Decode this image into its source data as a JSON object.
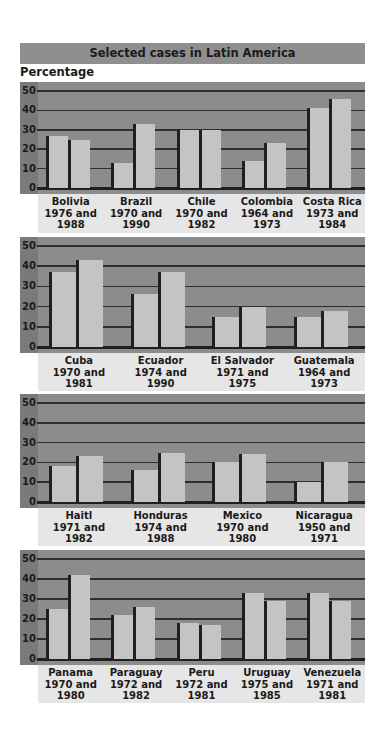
{
  "header": {
    "title": "Selected cases in Latin America",
    "ylabel": "Percentage"
  },
  "colors": {
    "title_bar": "#8f8f8f",
    "plot_bg": "#8c8c8c",
    "axis_strip": "#7a7a7a",
    "bar": "#c4c4c4",
    "label_bg": "#e6e6e6",
    "lines": "#1f1f1f"
  },
  "ticks": [
    "50",
    "40",
    "30",
    "20",
    "10",
    "0"
  ],
  "chart_data": [
    {
      "type": "bar",
      "title": "Selected cases in Latin America",
      "ylabel": "Percentage",
      "ylim": [
        0,
        50
      ],
      "grid": true,
      "categories": [
        "Bolivia 1976 and 1988",
        "Brazil 1970 and 1990",
        "Chile 1970 and 1982",
        "Colombia 1964 and 1973",
        "Costa Rica 1973 and 1984"
      ],
      "series": [
        {
          "name": "Earlier year",
          "values": [
            27,
            13,
            30,
            14,
            41
          ]
        },
        {
          "name": "Later year",
          "values": [
            25,
            33,
            30,
            23,
            46
          ]
        }
      ]
    },
    {
      "type": "bar",
      "ylabel": "Percentage",
      "ylim": [
        0,
        50
      ],
      "grid": true,
      "categories": [
        "Cuba 1970 and 1981",
        "Ecuador 1974 and 1990",
        "El Salvador 1971 and 1975",
        "Guatemala 1964 and 1973"
      ],
      "series": [
        {
          "name": "Earlier year",
          "values": [
            37,
            26,
            15,
            15
          ]
        },
        {
          "name": "Later year",
          "values": [
            43,
            37,
            20,
            18
          ]
        }
      ]
    },
    {
      "type": "bar",
      "ylabel": "Percentage",
      "ylim": [
        0,
        50
      ],
      "grid": true,
      "categories": [
        "Haitl 1971 and 1982",
        "Honduras 1974 and 1988",
        "Mexico 1970 and 1980",
        "Nicaragua 1950 and 1971"
      ],
      "series": [
        {
          "name": "Earlier year",
          "values": [
            18,
            16,
            20,
            10
          ]
        },
        {
          "name": "Later year",
          "values": [
            23,
            25,
            24,
            20
          ]
        }
      ]
    },
    {
      "type": "bar",
      "ylabel": "Percentage",
      "ylim": [
        0,
        50
      ],
      "grid": true,
      "categories": [
        "Panama 1970 and 1980",
        "Paraguay 1972 and 1982",
        "Peru 1972 and 1981",
        "Uruguay 1975 and 1985",
        "Venezuela 1971 and 1981"
      ],
      "series": [
        {
          "name": "Earlier year",
          "values": [
            25,
            22,
            18,
            33,
            33
          ]
        },
        {
          "name": "Later year",
          "values": [
            42,
            26,
            17,
            29,
            29
          ]
        }
      ]
    }
  ],
  "panels": [
    {
      "top": 82,
      "plot_h": 112,
      "label_h": 39,
      "groups": [
        {
          "label": "Bolivia\n1976 and\n1988",
          "a": 27,
          "b": 25
        },
        {
          "label": "Brazil\n1970 and\n1990",
          "a": 13,
          "b": 33
        },
        {
          "label": "Chile\n1970 and\n1982",
          "a": 30,
          "b": 30
        },
        {
          "label": "Colombia\n1964 and\n1973",
          "a": 14,
          "b": 23
        },
        {
          "label": "Costa Rica\n1973 and\n1984",
          "a": 41,
          "b": 46
        }
      ]
    },
    {
      "top": 237,
      "plot_h": 116,
      "label_h": 38,
      "groups": [
        {
          "label": "Cuba\n1970 and\n1981",
          "a": 37,
          "b": 43
        },
        {
          "label": "Ecuador\n1974 and\n1990",
          "a": 26,
          "b": 37
        },
        {
          "label": "El Salvador\n1971 and\n1975",
          "a": 15,
          "b": 20
        },
        {
          "label": "Guatemala\n1964 and\n1973",
          "a": 15,
          "b": 18
        }
      ]
    },
    {
      "top": 394,
      "plot_h": 114,
      "label_h": 38,
      "groups": [
        {
          "label": "Haitl\n1971 and\n1982",
          "a": 18,
          "b": 23
        },
        {
          "label": "Honduras\n1974 and\n1988",
          "a": 16,
          "b": 25
        },
        {
          "label": "Mexico\n1970 and\n1980",
          "a": 20,
          "b": 24
        },
        {
          "label": "Nicaragua\n1950 and\n1971",
          "a": 10,
          "b": 20
        }
      ]
    },
    {
      "top": 550,
      "plot_h": 115,
      "label_h": 38,
      "groups": [
        {
          "label": "Panama\n1970 and\n1980",
          "a": 25,
          "b": 42
        },
        {
          "label": "Paraguay\n1972 and\n1982",
          "a": 22,
          "b": 26
        },
        {
          "label": "Peru\n1972 and\n1981",
          "a": 18,
          "b": 17
        },
        {
          "label": "Uruguay\n1975 and\n1985",
          "a": 33,
          "b": 29
        },
        {
          "label": "Venezuela\n1971 and\n1981",
          "a": 33,
          "b": 29
        }
      ]
    }
  ]
}
